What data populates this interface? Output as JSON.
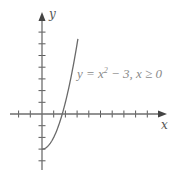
{
  "chart_data": {
    "type": "line",
    "title": "",
    "xlabel": "x",
    "ylabel": "y",
    "annotation": "y = x² − 3, x ≥ 0",
    "function": "y = x^2 - 3",
    "domain": [
      0,
      3.07
    ],
    "series": [
      {
        "name": "y = x² − 3, x ≥ 0",
        "x": [
          0,
          0.5,
          1,
          1.5,
          1.732,
          2,
          2.5,
          3,
          3.07
        ],
        "y": [
          -3,
          -2.75,
          -2,
          -0.75,
          0,
          1,
          3.25,
          6,
          6.42
        ]
      }
    ],
    "xlim": [
      -2.8,
      10.6
    ],
    "ylim": [
      -4.8,
      8.6
    ],
    "x_ticks": [
      -2,
      -1,
      1,
      2,
      3,
      4,
      5,
      6,
      7,
      8,
      9
    ],
    "y_ticks": [
      -4,
      -3,
      -2,
      -1,
      1,
      2,
      3,
      4,
      5,
      6,
      7
    ],
    "tick_labels_shown": false,
    "grid": false,
    "legend": "none",
    "colors": {
      "axis": "#6e6e6e",
      "curve": "#6a6a6a",
      "annotation": "#8a8a8a"
    }
  },
  "labels": {
    "x_axis": "x",
    "y_axis": "y",
    "equation_main": "y = x",
    "equation_sup": "2",
    "equation_rest": " − 3, x ≥ 0"
  }
}
